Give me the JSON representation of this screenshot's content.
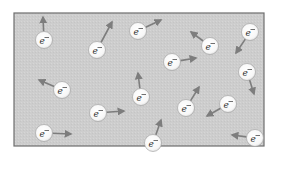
{
  "diagram": {
    "box": {
      "x": 14,
      "y": 13,
      "width": 250,
      "height": 133,
      "fill": "#cfcfcf",
      "stroke": "#6e6e6e"
    },
    "electron_label": "e",
    "electron_charge": "−",
    "colors": {
      "electron_fill": "#ffffff",
      "electron_stroke": "#9a9a9a",
      "arrow": "#7d7d7d",
      "label": "#333333"
    },
    "electrons": [
      {
        "cx": 44,
        "cy": 40,
        "ax": 43,
        "ay": 17
      },
      {
        "cx": 97,
        "cy": 50,
        "ax": 112,
        "ay": 22
      },
      {
        "cx": 138,
        "cy": 31,
        "ax": 161,
        "ay": 20
      },
      {
        "cx": 172,
        "cy": 62,
        "ax": 196,
        "ay": 58
      },
      {
        "cx": 210,
        "cy": 46,
        "ax": 191,
        "ay": 32
      },
      {
        "cx": 250,
        "cy": 32,
        "ax": 236,
        "ay": 53
      },
      {
        "cx": 247,
        "cy": 72,
        "ax": 254,
        "ay": 94
      },
      {
        "cx": 62,
        "cy": 90,
        "ax": 39,
        "ay": 80
      },
      {
        "cx": 141,
        "cy": 97,
        "ax": 138,
        "ay": 73
      },
      {
        "cx": 98,
        "cy": 113,
        "ax": 124,
        "ay": 111
      },
      {
        "cx": 186,
        "cy": 108,
        "ax": 199,
        "ay": 87
      },
      {
        "cx": 228,
        "cy": 104,
        "ax": 207,
        "ay": 116
      },
      {
        "cx": 44,
        "cy": 133,
        "ax": 71,
        "ay": 134
      },
      {
        "cx": 153,
        "cy": 143,
        "ax": 161,
        "ay": 120
      },
      {
        "cx": 255,
        "cy": 138,
        "ax": 232,
        "ay": 135
      }
    ]
  }
}
